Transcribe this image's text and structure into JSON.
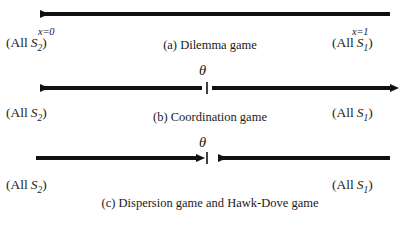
{
  "figure": {
    "stroke_color": "#111111",
    "background": "#ffffff"
  },
  "panels": [
    {
      "id": "a",
      "caption": "(a) Dilemma game",
      "left_endpoint": {
        "x_label": "x=0",
        "paren_open": "(",
        "all": "All",
        "symbol": "S",
        "subscript": "2",
        "paren_close": ")"
      },
      "right_endpoint": {
        "x_label": "x=1",
        "paren_open": "(",
        "all": "All",
        "symbol": "S",
        "subscript": "1",
        "paren_close": ")"
      },
      "arrow_direction": "left",
      "theta": null
    },
    {
      "id": "b",
      "caption": "(b) Coordination game",
      "left_endpoint": {
        "paren_open": "(",
        "all": "All",
        "symbol": "S",
        "subscript": "2",
        "paren_close": ")"
      },
      "right_endpoint": {
        "paren_open": "(",
        "all": "All",
        "symbol": "S",
        "subscript": "1",
        "paren_close": ")"
      },
      "arrow_direction": "outward",
      "theta": "θ"
    },
    {
      "id": "c",
      "caption": "(c) Dispersion game and Hawk-Dove game",
      "left_endpoint": {
        "paren_open": "(",
        "all": "All",
        "symbol": "S",
        "subscript": "2",
        "paren_close": ")"
      },
      "right_endpoint": {
        "paren_open": "(",
        "all": "All",
        "symbol": "S",
        "subscript": "1",
        "paren_close": ")"
      },
      "arrow_direction": "inward",
      "theta": "θ"
    }
  ]
}
